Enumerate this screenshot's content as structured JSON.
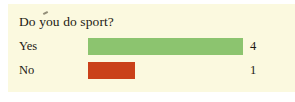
{
  "panel": {
    "background_color": "#fbf9df",
    "page_background_color": "#ffffff"
  },
  "chart_data": {
    "type": "bar",
    "orientation": "horizontal",
    "title": "Do you do sport?",
    "xlabel": "",
    "ylabel": "",
    "categories": [
      "Yes",
      "No"
    ],
    "values": [
      4,
      1
    ],
    "value_labels": [
      "4",
      "1"
    ],
    "colors": [
      "#8cc46f",
      "#ca4119"
    ],
    "xlim": [
      0,
      4
    ],
    "grid": false,
    "legend": null,
    "axis_ticks_visible": false,
    "series": [
      {
        "name": "Responses",
        "values": [
          4,
          1
        ]
      }
    ],
    "bars": [
      {
        "category": "Yes",
        "value": 4,
        "value_label": "4",
        "color": "#8cc46f",
        "width_pct": 100
      },
      {
        "category": "No",
        "value": 1,
        "value_label": "1",
        "color": "#ca4119",
        "width_pct": 30
      }
    ]
  }
}
